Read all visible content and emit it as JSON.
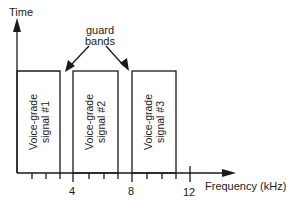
{
  "diagram": {
    "y_axis_label": "Time",
    "x_axis_label": "Frequency (kHz)",
    "annotation": {
      "line1": "guard",
      "line2": "bands"
    },
    "ticks": [
      {
        "value": "4"
      },
      {
        "value": "8"
      },
      {
        "value": "12"
      }
    ],
    "boxes": [
      {
        "line1": "Voice-grade",
        "line2": "signal #1"
      },
      {
        "line1": "Voice-grade",
        "line2": "signal #2"
      },
      {
        "line1": "Voice-grade",
        "line2": "signal #3"
      }
    ]
  }
}
